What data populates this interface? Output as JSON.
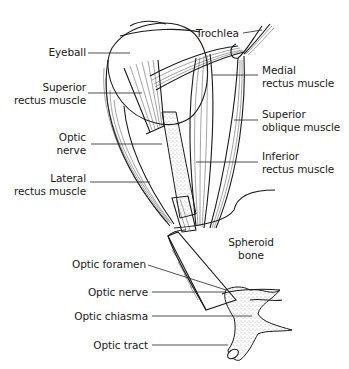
{
  "figure": {
    "type": "anatomical line illustration"
  },
  "labels": {
    "eyeball": "Eyeball",
    "superior_rectus": [
      "Superior",
      "rectus muscle"
    ],
    "optic_nerve_upper": [
      "Optic",
      "nerve"
    ],
    "lateral_rectus": [
      "Lateral",
      "rectus muscle"
    ],
    "trochlea": "Trochlea",
    "medial_rectus": [
      "Medial",
      "rectus muscle"
    ],
    "superior_oblique": [
      "Superior",
      "oblique muscle"
    ],
    "inferior_rectus": [
      "Inferior",
      "rectus muscle"
    ],
    "spheroid_bone": [
      "Spheroid",
      "bone"
    ],
    "optic_foramen": "Optic foramen",
    "optic_nerve_lower": "Optic nerve",
    "optic_chiasma": "Optic chiasma",
    "optic_tract": "Optic tract"
  },
  "colors": {
    "line": "#1a1a1a",
    "background": "#ffffff",
    "stipple": "#555555"
  }
}
